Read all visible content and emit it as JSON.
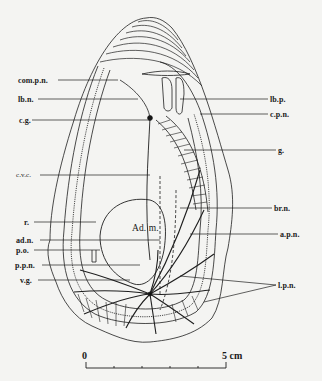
{
  "figure": {
    "center_label": "Ad. m.",
    "labels_left": [
      {
        "id": "com-p-n",
        "text": "com.p.n."
      },
      {
        "id": "lb-n",
        "text": "lb.n."
      },
      {
        "id": "c-g",
        "text": "c.g."
      },
      {
        "id": "c-v-c",
        "text": "c.v.c."
      },
      {
        "id": "r",
        "text": "r."
      },
      {
        "id": "ad-n",
        "text": "ad.n."
      },
      {
        "id": "p-o",
        "text": "p.o."
      },
      {
        "id": "p-p-n",
        "text": "p.p.n."
      },
      {
        "id": "v-g",
        "text": "v.g."
      }
    ],
    "labels_right": [
      {
        "id": "lb-p",
        "text": "lb.p."
      },
      {
        "id": "c-p-n",
        "text": "c.p.n."
      },
      {
        "id": "g",
        "text": "g."
      },
      {
        "id": "br-n",
        "text": "br.n."
      },
      {
        "id": "a-p-n",
        "text": "a.p.n."
      },
      {
        "id": "l-p-n",
        "text": "l.p.n."
      }
    ],
    "scale_bar": {
      "start_label": "0",
      "end_label": "5 cm",
      "ticks": 5
    }
  }
}
